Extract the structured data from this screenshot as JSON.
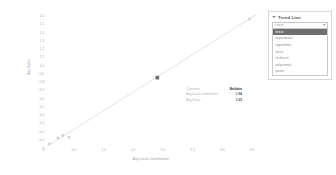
{
  "chart_data": {
    "type": "scatter",
    "title": "",
    "xlabel": "Avg Local Contribution",
    "ylabel": "Avg Sales",
    "grid": false,
    "legend": "none",
    "xlim": [
      0,
      3.5
    ],
    "ylim": [
      0,
      1.6
    ],
    "x_ticks": [
      "0",
      "0.25",
      "0.5",
      "0.75",
      "1.0",
      "1.25",
      "1.5",
      "1.75",
      "2.0",
      "2.25",
      "2.5",
      "2.75",
      "3.0",
      "3.25",
      "3.5"
    ],
    "y_ticks": [
      "1.6",
      "1.5",
      "1.4",
      "1.3",
      "1.2",
      "1.1",
      "1.0",
      "0.9",
      "0.8",
      "0.7",
      "0.6",
      "0.5",
      "0.4",
      "0.3",
      "0.2",
      "0.1",
      "0"
    ],
    "points": [
      {
        "x": 0.09,
        "y": 0.05,
        "label": "A",
        "highlighted": false
      },
      {
        "x": 0.22,
        "y": 0.12,
        "label": "B",
        "highlighted": false
      },
      {
        "x": 0.3,
        "y": 0.15,
        "label": "C",
        "highlighted": false
      },
      {
        "x": 0.4,
        "y": 0.13,
        "label": "D",
        "highlighted": false
      },
      {
        "x": 1.82,
        "y": 0.84,
        "label": "E",
        "highlighted": true
      },
      {
        "x": 3.3,
        "y": 1.54,
        "label": "F",
        "highlighted": false
      }
    ],
    "trendline": {
      "kind": "linear",
      "from": {
        "x": 0.05,
        "y": 0.02
      },
      "to": {
        "x": 3.42,
        "y": 1.6
      }
    }
  },
  "tooltip": {
    "rows": [
      {
        "label": "Customer",
        "value": "Baldwin",
        "header": true
      },
      {
        "label": "Avg Local Contribution",
        "value": "1.94",
        "header": false
      },
      {
        "label": "Avg Sales",
        "value": "1.03",
        "header": false
      }
    ]
  },
  "trend_panel": {
    "title": "Trend Line",
    "collapse_icon": "chevron-down-icon",
    "select": {
      "value": "linear",
      "caret_icon": "chevron-down-icon",
      "options": [
        "linear",
        "exponential",
        "logarithmic",
        "loess",
        "technical",
        "polynomial",
        "power"
      ],
      "selected_index": 0
    }
  },
  "colors": {
    "axis_text": "#a6a6a6",
    "axis_title": "#9a9a9a",
    "point": "#d4d4d4",
    "point_highlight": "#6b6b6b",
    "trendline": "#e2e2e2",
    "panel_border": "#d8d8d8",
    "option_selected_bg": "#6f6f6f",
    "tooltip_value": "#4a4a4a"
  }
}
